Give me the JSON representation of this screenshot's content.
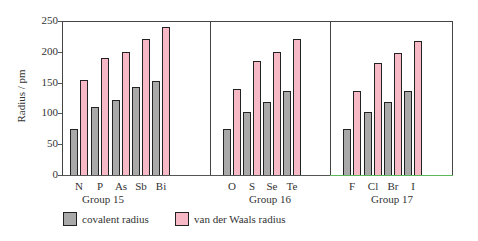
{
  "chart_data": {
    "type": "bar",
    "title": "",
    "xlabel": "",
    "ylabel": "Radius / pm",
    "ylim": [
      0,
      250
    ],
    "yticks": [
      0,
      50,
      100,
      150,
      200,
      250
    ],
    "groups": [
      {
        "name": "Group 15",
        "categories": [
          "N",
          "P",
          "As",
          "Sb",
          "Bi"
        ]
      },
      {
        "name": "Group 16",
        "categories": [
          "O",
          "S",
          "Se",
          "Te"
        ]
      },
      {
        "name": "Group 17",
        "categories": [
          "F",
          "Cl",
          "Br",
          "I"
        ]
      }
    ],
    "categories": [
      "N",
      "P",
      "As",
      "Sb",
      "Bi",
      "O",
      "S",
      "Se",
      "Te",
      "F",
      "Cl",
      "Br",
      "I"
    ],
    "series": [
      {
        "name": "covalent radius",
        "color": "#a9a9a9",
        "values": [
          75,
          110,
          122,
          143,
          152,
          74,
          103,
          119,
          137,
          75,
          103,
          118,
          137
        ]
      },
      {
        "name": "van der Waals radius",
        "color": "#f7b9c6",
        "values": [
          155,
          190,
          200,
          220,
          240,
          140,
          185,
          200,
          220,
          136,
          182,
          198,
          217
        ]
      }
    ],
    "legend_position": "bottom-left",
    "grid": false
  },
  "axis": {
    "ylabel": "Radius / pm",
    "ticks": [
      "0",
      "50",
      "100",
      "150",
      "200",
      "250"
    ]
  },
  "groups": [
    "Group 15",
    "Group 16",
    "Group 17"
  ],
  "elements": [
    "N",
    "P",
    "As",
    "Sb",
    "Bi",
    "O",
    "S",
    "Se",
    "Te",
    "F",
    "Cl",
    "Br",
    "I"
  ],
  "legend": {
    "covalent": "covalent radius",
    "vdw": "van der Waals radius"
  }
}
